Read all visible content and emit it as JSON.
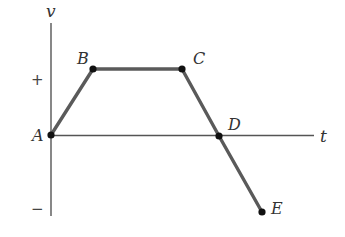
{
  "diagram": {
    "type": "velocity-time graph",
    "axes": {
      "vertical_label": "v",
      "horizontal_label": "t",
      "positive_sign": "+",
      "negative_sign": "−"
    },
    "points": [
      {
        "id": "A",
        "label": "A",
        "x": 51,
        "y": 135
      },
      {
        "id": "B",
        "label": "B",
        "x": 93,
        "y": 69
      },
      {
        "id": "C",
        "label": "C",
        "x": 182,
        "y": 69
      },
      {
        "id": "D",
        "label": "D",
        "x": 219,
        "y": 136
      },
      {
        "id": "E",
        "label": "E",
        "x": 262,
        "y": 212
      }
    ],
    "segments": [
      [
        "A",
        "B"
      ],
      [
        "B",
        "C"
      ],
      [
        "C",
        "D"
      ],
      [
        "D",
        "E"
      ]
    ],
    "colors": {
      "curve": "#555555",
      "axis": "#555555",
      "point": "#111111",
      "text": "#333333"
    }
  }
}
